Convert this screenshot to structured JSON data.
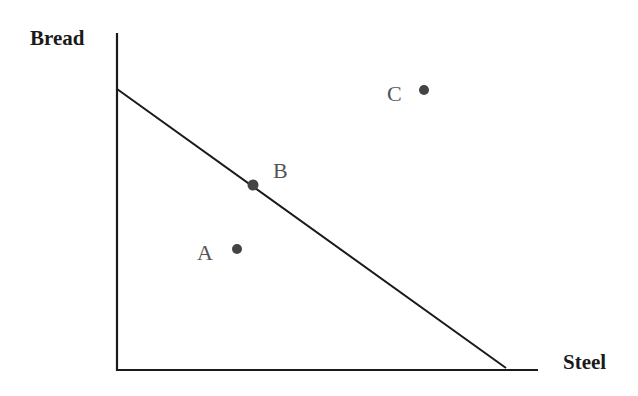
{
  "diagram": {
    "type": "production-possibilities-frontier",
    "y_axis_label": "Bread",
    "x_axis_label": "Steel",
    "colors": {
      "line": "#1a1a1a",
      "point": "#444444",
      "label": "#555555"
    },
    "frontier": {
      "y_intercept": [
        117,
        89
      ],
      "x_intercept": [
        506,
        368
      ]
    },
    "points": [
      {
        "label": "A",
        "position": "inside frontier",
        "x": 237,
        "y": 249
      },
      {
        "label": "B",
        "position": "on frontier",
        "x": 253,
        "y": 185
      },
      {
        "label": "C",
        "position": "outside frontier",
        "x": 424,
        "y": 90
      }
    ]
  }
}
